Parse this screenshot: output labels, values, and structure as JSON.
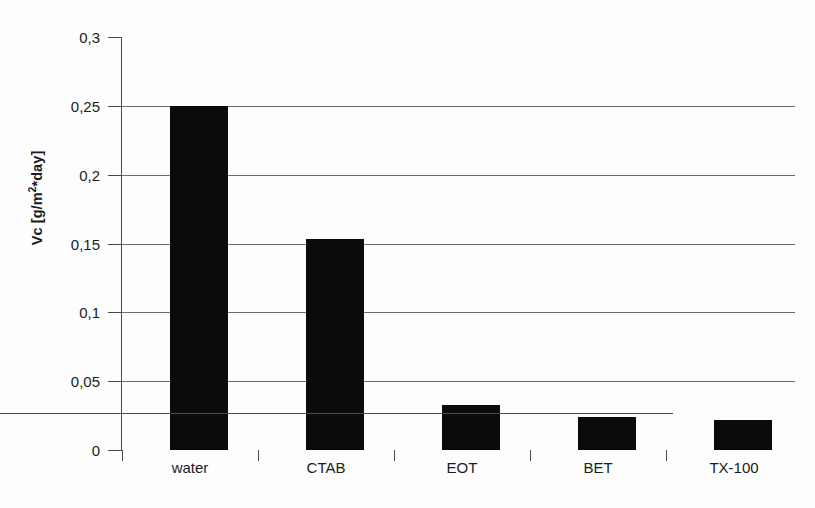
{
  "chart_data": {
    "type": "bar",
    "title": "",
    "subtitle": "",
    "categories": [
      "water",
      "CTAB",
      "EOT",
      "BET",
      "TX-100"
    ],
    "values": [
      0.25,
      0.153,
      0.033,
      0.024,
      0.022
    ],
    "xlabel": "",
    "ylabel": "Vc [g/m²*day]",
    "ylabel_parts": {
      "prefix": "Vc [g/m",
      "exponent": "2",
      "suffix": "*day]"
    },
    "ylim": [
      0,
      0.3
    ],
    "ytick_values": [
      0,
      0.05,
      0.1,
      0.15,
      0.2,
      0.25,
      0.3
    ],
    "ytick_labels": [
      "0",
      "0,05",
      "0,1",
      "0,15",
      "0,2",
      "0,25",
      "0,3"
    ],
    "decimal_separator": ",",
    "grid": {
      "horizontal": true,
      "vertical": false,
      "gridline_values": [
        0.05,
        0.1,
        0.15,
        0.2,
        0.25
      ]
    },
    "legend": {
      "visible": false,
      "position": "none"
    },
    "bar_color": "#0b0b0b",
    "background_color": "#fdfdfd",
    "axis_color": "#4a4a4a",
    "gridline_color": "#6b6b6b"
  }
}
